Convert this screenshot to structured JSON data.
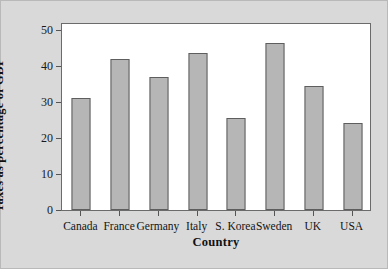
{
  "chart_data": {
    "type": "bar",
    "title": "",
    "xlabel": "Country",
    "ylabel": "Taxes as percentage of GDP",
    "categories": [
      "Canada",
      "France",
      "Germany",
      "Italy",
      "S. Korea",
      "Sweden",
      "UK",
      "USA"
    ],
    "values": [
      31.1,
      42.0,
      37.0,
      43.5,
      25.6,
      46.4,
      34.4,
      24.2
    ],
    "ylim": [
      0,
      52.2
    ],
    "yticks": [
      0,
      10,
      20,
      30,
      40,
      50
    ],
    "ytick_labels": [
      "0",
      "10",
      "20",
      "30",
      "40",
      "50"
    ],
    "grid": false,
    "legend": null,
    "bar_color": "#b6b6b6",
    "bar_edge_color": "#5e5e5e",
    "plot_background": "#ffffff",
    "figure_background": "#d9d9d9",
    "axis_color": "#6b6b6b",
    "text_color": "#141414"
  }
}
